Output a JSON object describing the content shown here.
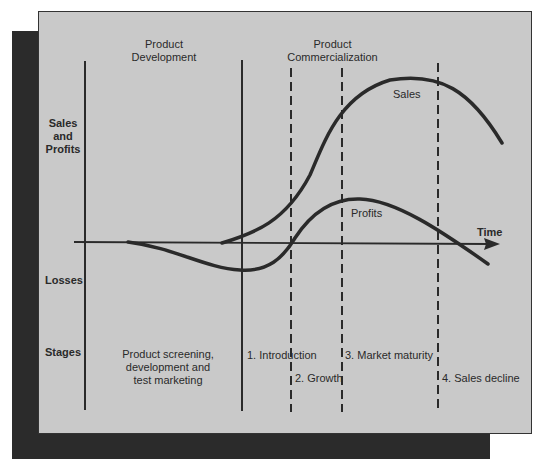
{
  "header": {
    "phase_left": "Product\nDevelopment",
    "phase_right": "Product\nCommercialization"
  },
  "y_axis": {
    "positive_label": "Sales\nand\nProfits",
    "negative_label": "Losses",
    "stages_label": "Stages"
  },
  "x_axis": {
    "label": "Time"
  },
  "curves": {
    "sales_label": "Sales",
    "profits_label": "Profits"
  },
  "stages": {
    "development": "Product screening,\ndevelopment and\ntest marketing",
    "introduction": "1. Introduction",
    "growth": "2. Growth",
    "maturity": "3. Market maturity",
    "decline": "4. Sales decline"
  },
  "colors": {
    "panel": "#c9c9c9",
    "shadow": "#2b2b2b",
    "ink": "#2a2a2a"
  }
}
